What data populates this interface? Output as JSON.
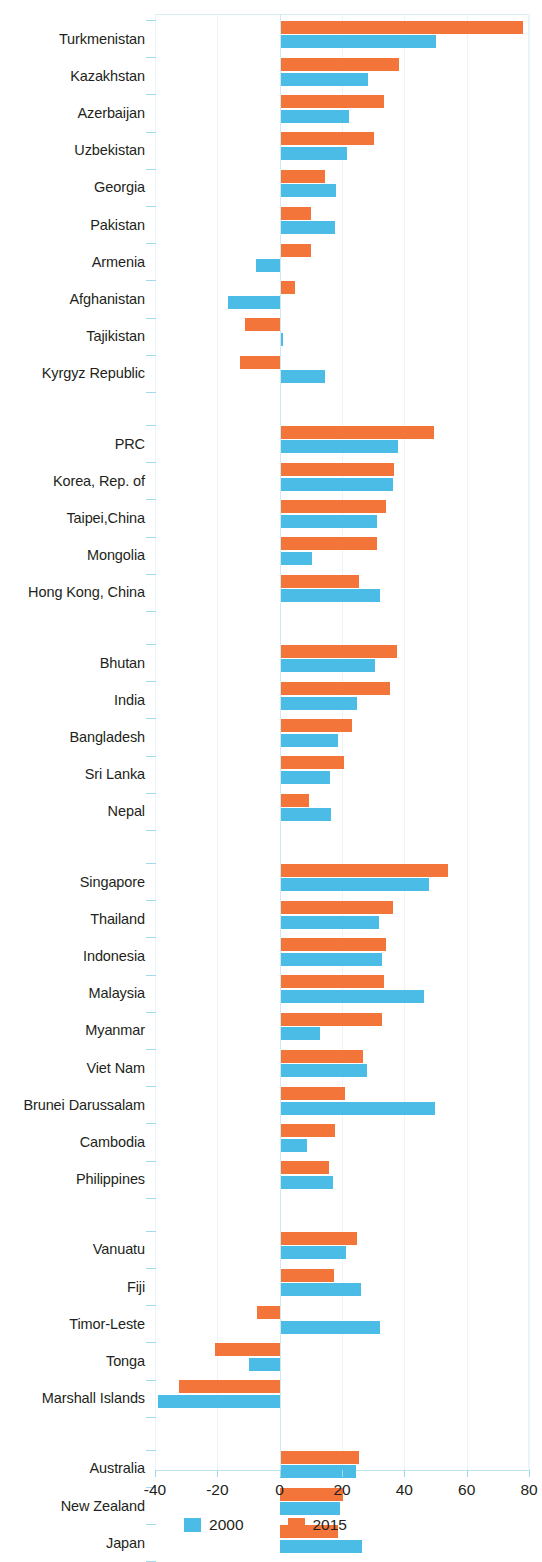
{
  "chart_data": {
    "type": "bar",
    "orientation": "horizontal",
    "title": "",
    "xlabel": "",
    "ylabel": "",
    "xlim": [
      -40,
      80
    ],
    "xticks": [
      -40,
      -20,
      0,
      20,
      40,
      60,
      80
    ],
    "xticklabels": [
      "-40",
      "-20",
      "0",
      "20",
      "40",
      "60",
      "80"
    ],
    "grid": true,
    "legend_position": "bottom-center",
    "colors": {
      "2000": "#4bbce5",
      "2015": "#f4753a"
    },
    "series": [
      {
        "name": "2000",
        "color": "#4bbce5"
      },
      {
        "name": "2015",
        "color": "#f4753a"
      }
    ],
    "groups": [
      {
        "name": "Central and West Asia",
        "categories": [
          "Turkmenistan",
          "Kazakhstan",
          "Azerbaijan",
          "Uzbekistan",
          "Georgia",
          "Pakistan",
          "Armenia",
          "Afghanistan",
          "Tajikistan",
          "Kyrgyz Republic"
        ],
        "values_2000": [
          50.1,
          28.3,
          22.4,
          21.7,
          18.1,
          17.9,
          -7.5,
          -16.7,
          1.0,
          14.7
        ],
        "values_2015": [
          78.0,
          38.2,
          33.6,
          30.3,
          14.4,
          10.1,
          10.1,
          4.8,
          -11.0,
          -12.8
        ]
      },
      {
        "name": "East Asia",
        "categories": [
          "PRC",
          "Korea, Rep. of",
          "Taipei,China",
          "Mongolia",
          "Hong Kong, China"
        ],
        "values_2000": [
          37.9,
          36.3,
          31.1,
          10.3,
          32.3
        ],
        "values_2015": [
          49.4,
          36.8,
          34.1,
          31.1,
          25.6
        ]
      },
      {
        "name": "South Asia",
        "categories": [
          "Bhutan",
          "India",
          "Bangladesh",
          "Sri Lanka",
          "Nepal"
        ],
        "values_2000": [
          30.7,
          24.9,
          18.7,
          16.2,
          16.5
        ],
        "values_2015": [
          37.5,
          35.4,
          23.1,
          20.8,
          9.4
        ]
      },
      {
        "name": "Southeast Asia",
        "categories": [
          "Singapore",
          "Thailand",
          "Indonesia",
          "Malaysia",
          "Myanmar",
          "Viet Nam",
          "Brunei Darussalam",
          "Cambodia",
          "Philippines"
        ],
        "values_2000": [
          48.0,
          32.0,
          32.7,
          46.4,
          12.8,
          28.0,
          49.8,
          8.9,
          17.1
        ],
        "values_2015": [
          54.1,
          36.5,
          34.1,
          33.6,
          32.7,
          26.9,
          21.0,
          17.8,
          15.7
        ]
      },
      {
        "name": "The Pacific",
        "categories": [
          "Vanuatu",
          "Fiji",
          "Timor-Leste",
          "Tonga",
          "Marshall Islands"
        ],
        "values_2000": [
          21.3,
          26.1,
          32.3,
          -9.9,
          -38.9
        ],
        "values_2015": [
          24.7,
          17.4,
          -7.3,
          -20.8,
          -32.2
        ]
      },
      {
        "name": "Developed Economies",
        "categories": [
          "Australia",
          "New Zealand",
          "Japan"
        ],
        "values_2000": [
          24.5,
          19.5,
          26.3
        ],
        "values_2015": [
          25.4,
          20.3,
          18.7
        ]
      }
    ]
  }
}
